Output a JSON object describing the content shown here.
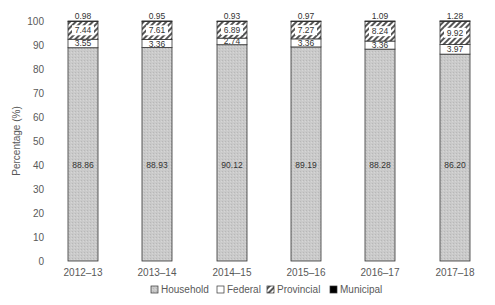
{
  "chart_data": {
    "type": "bar",
    "stacked": true,
    "title": "",
    "xlabel": "",
    "ylabel": "Percentage (%)",
    "ylim": [
      0,
      100
    ],
    "yticks": [
      0,
      10,
      20,
      30,
      40,
      50,
      60,
      70,
      80,
      90,
      100
    ],
    "categories": [
      "2012–13",
      "2013–14",
      "2014–15",
      "2015–16",
      "2016–17",
      "2017–18"
    ],
    "series": [
      {
        "name": "Household",
        "values": [
          88.86,
          88.93,
          90.12,
          89.19,
          88.28,
          86.2
        ],
        "labels": [
          "88.86",
          "88.93",
          "90.12",
          "89.19",
          "88.28",
          "86.20"
        ],
        "fill": "#c8c8c8",
        "pattern": "dotted-gray"
      },
      {
        "name": "Federal",
        "values": [
          3.55,
          3.36,
          2.74,
          3.36,
          3.36,
          3.97
        ],
        "labels": [
          "3.55",
          "3.36",
          "2.74",
          "3.36",
          "3.36",
          "3.97"
        ],
        "fill": "#ffffff",
        "pattern": "none"
      },
      {
        "name": "Provincial",
        "values": [
          7.44,
          7.61,
          6.89,
          7.27,
          8.24,
          9.92
        ],
        "labels": [
          "7.44",
          "7.61",
          "6.89",
          "7.27",
          "8.24",
          "9.92"
        ],
        "fill": "#9a9a9a",
        "pattern": "diagonal-hatch"
      },
      {
        "name": "Municipal",
        "values": [
          0.98,
          0.95,
          0.93,
          0.97,
          1.09,
          1.28
        ],
        "labels": [
          "0.98",
          "0.95",
          "0.93",
          "0.97",
          "1.09",
          "1.28"
        ],
        "fill": "#000000",
        "pattern": "none"
      }
    ],
    "legend_position": "bottom",
    "grid": false
  }
}
